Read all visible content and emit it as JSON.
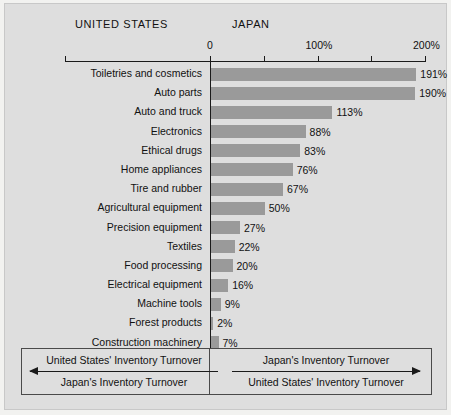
{
  "headers": {
    "left": "UNITED STATES",
    "right": "JAPAN"
  },
  "footer": {
    "left": {
      "numerator": "United States' Inventory Turnover",
      "denominator": "Japan's Inventory Turnover"
    },
    "right": {
      "numerator": "Japan's Inventory Turnover",
      "denominator": "United States' Inventory Turnover"
    }
  },
  "colors": {
    "background": "#dedede",
    "bar": "#9a9a9a",
    "axis": "#1a1a1a",
    "text": "#111111"
  },
  "chart_data": {
    "type": "bar",
    "orientation": "horizontal",
    "title": "",
    "xlabel": "",
    "ylabel": "",
    "xlim": [
      0,
      200
    ],
    "grid": false,
    "legend": null,
    "tick_values": [
      0,
      50,
      100,
      150,
      200
    ],
    "tick_labels": [
      "0",
      "",
      "100%",
      "",
      "200%"
    ],
    "categories": [
      "Toiletries and cosmetics",
      "Auto parts",
      "Auto and truck",
      "Electronics",
      "Ethical drugs",
      "Home appliances",
      "Tire and rubber",
      "Agricultural equipment",
      "Precision equipment",
      "Textiles",
      "Food processing",
      "Electrical equipment",
      "Machine tools",
      "Forest products",
      "Construction machinery"
    ],
    "values": [
      191,
      190,
      113,
      88,
      83,
      76,
      67,
      50,
      27,
      22,
      20,
      16,
      9,
      2,
      7
    ],
    "value_labels": [
      "191%",
      "190%",
      "113%",
      "88%",
      "83%",
      "76%",
      "67%",
      "50%",
      "27%",
      "22%",
      "20%",
      "16%",
      "9%",
      "2%",
      "7%"
    ]
  }
}
